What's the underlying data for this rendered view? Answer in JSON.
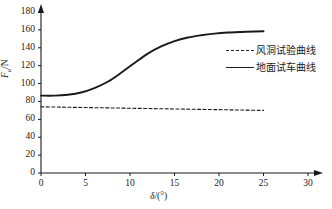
{
  "chart_data": {
    "type": "line",
    "title": "",
    "xlabel": "δ/(°)",
    "ylabel": "Fₐ/N",
    "ylabel_main": "F",
    "ylabel_sub": "a",
    "ylabel_unit": "/N",
    "xlabel_symbol": "δ",
    "xlabel_unit": "/(°)",
    "xlim": [
      0,
      30
    ],
    "ylim": [
      0,
      180
    ],
    "xticks": [
      0,
      5,
      10,
      15,
      20,
      25,
      30
    ],
    "yticks": [
      0,
      20,
      40,
      60,
      80,
      100,
      120,
      140,
      160,
      180
    ],
    "xtick_labels": [
      "0",
      "5",
      "10",
      "15",
      "20",
      "25",
      "30"
    ],
    "ytick_labels": [
      "0",
      "20",
      "40",
      "60",
      "80",
      "100",
      "120",
      "140",
      "160",
      "180"
    ],
    "grid": false,
    "legend_position": "right-upper",
    "axis_arrows": true,
    "line_color": "#1a1a1a",
    "series": [
      {
        "name": "风洞试验曲线",
        "style": "dashed",
        "color": "#1a1a1a",
        "x": [
          0,
          2.5,
          5,
          7.5,
          10,
          12.5,
          15,
          17.5,
          20,
          22.5,
          25
        ],
        "values": [
          74.0,
          73.6,
          73.2,
          72.8,
          72.4,
          72.0,
          71.6,
          71.2,
          70.8,
          70.4,
          70.0
        ]
      },
      {
        "name": "地面试车曲线",
        "style": "solid",
        "color": "#1a1a1a",
        "x": [
          0,
          1.5,
          3,
          4.5,
          6,
          7.5,
          9,
          10.5,
          12,
          13.5,
          15,
          16.5,
          18,
          19.5,
          21,
          22.5,
          24,
          25
        ],
        "values": [
          86.5,
          86.5,
          87.5,
          90.0,
          95.0,
          102.0,
          112.0,
          123.0,
          133.5,
          141.5,
          147.5,
          151.5,
          154.0,
          155.8,
          157.0,
          157.7,
          158.2,
          158.5
        ]
      }
    ]
  },
  "legend": {
    "items": [
      {
        "label": "风洞试验曲线",
        "style": "dashed"
      },
      {
        "label": "地面试车曲线",
        "style": "solid"
      }
    ]
  }
}
